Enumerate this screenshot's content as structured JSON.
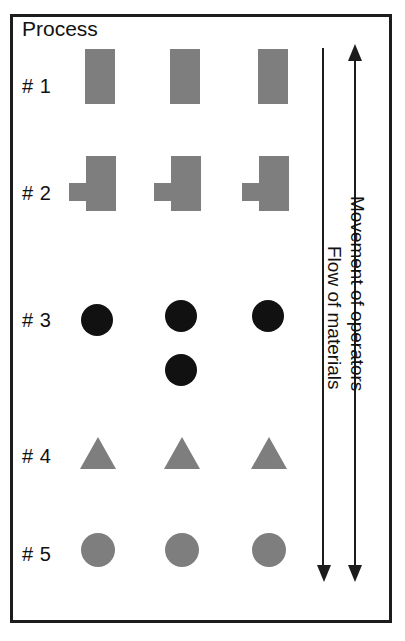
{
  "diagram": {
    "title": "Process",
    "frame_color": "#1c1c1c",
    "shape_gray": "#7e7e7e",
    "shape_black": "#111111",
    "rows": [
      {
        "label": "# 1",
        "shape": "rectangle",
        "shape_color": "#7e7e7e",
        "count": 3,
        "extra_below_middle": false
      },
      {
        "label": "# 2",
        "shape": "rectangle-with-left-tab",
        "shape_color": "#7e7e7e",
        "count": 3,
        "extra_below_middle": false
      },
      {
        "label": "# 3",
        "shape": "filled-circle",
        "shape_color": "#111111",
        "count": 3,
        "extra_below_middle": true
      },
      {
        "label": "# 4",
        "shape": "filled-triangle",
        "shape_color": "#7e7e7e",
        "count": 3,
        "extra_below_middle": false
      },
      {
        "label": "# 5",
        "shape": "filled-circle",
        "shape_color": "#7e7e7e",
        "count": 3,
        "extra_below_middle": false
      }
    ],
    "annotations": {
      "movement_of_operators": "Movement of operators",
      "flow_of_materials": "Flow of materials"
    },
    "arrows": {
      "operators_top": "arrow-up-icon",
      "operators_bottom": "arrow-down-icon",
      "materials_bottom": "arrow-down-icon"
    }
  }
}
